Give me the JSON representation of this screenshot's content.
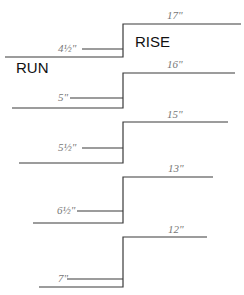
{
  "labels": {
    "run": "RUN",
    "rise": "RISE"
  },
  "steps": [
    {
      "rise": "4½\"",
      "run": "17\""
    },
    {
      "rise": "5\"",
      "run": "16\""
    },
    {
      "rise": "5½\"",
      "run": "15\""
    },
    {
      "rise": "6½\"",
      "run": "13\""
    },
    {
      "rise": "7\"",
      "run": "12\""
    }
  ]
}
